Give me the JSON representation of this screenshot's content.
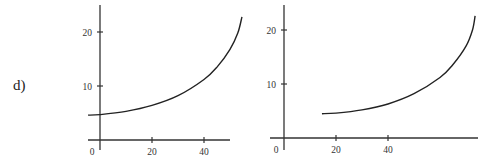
{
  "problem_label": "d)",
  "chart_data": [
    {
      "type": "line",
      "title": "",
      "xlabel": "",
      "ylabel": "",
      "x_ticks": [
        0,
        20,
        40
      ],
      "y_ticks": [
        10,
        20
      ],
      "xlim": [
        -4.6,
        50
      ],
      "ylim": [
        0,
        25
      ],
      "grid": false,
      "series": [
        {
          "name": "curve",
          "x": [
            -4.6,
            0,
            10,
            20,
            30,
            40,
            45,
            50,
            53,
            54.6
          ],
          "y": [
            4.6,
            4.7,
            5.3,
            6.4,
            8.2,
            11.2,
            13.5,
            16.8,
            19.8,
            22.8
          ]
        }
      ]
    },
    {
      "type": "line",
      "title": "",
      "xlabel": "",
      "ylabel": "",
      "x_ticks": [
        0,
        20,
        40
      ],
      "y_ticks": [
        10,
        20
      ],
      "xlim": [
        -5,
        75
      ],
      "ylim": [
        0,
        25
      ],
      "grid": false,
      "series": [
        {
          "name": "curve",
          "x": [
            14.6,
            20,
            30,
            40,
            50,
            60,
            65,
            70,
            72.5,
            73.5
          ],
          "y": [
            4.5,
            4.6,
            5.2,
            6.3,
            8.2,
            11.2,
            13.6,
            17.0,
            20.0,
            22.6
          ]
        }
      ]
    }
  ]
}
